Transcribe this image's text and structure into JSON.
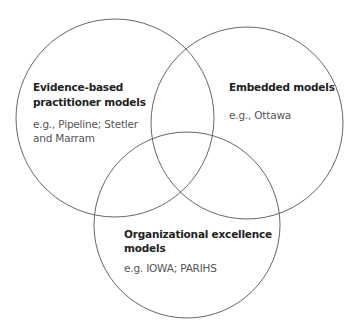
{
  "diagram": {
    "type": "venn",
    "circles": [
      {
        "id": "evidence-based",
        "title_lines": [
          "Evidence-based",
          "practitioner models"
        ],
        "example_lines": [
          "e.g., Pipeline; Stetler",
          "and Marram"
        ]
      },
      {
        "id": "embedded",
        "title_lines": [
          "Embedded models"
        ],
        "example_lines": [
          "e.g., Ottawa"
        ]
      },
      {
        "id": "organizational-excellence",
        "title_lines": [
          "Organizational excellence",
          "models"
        ],
        "example_lines": [
          "e.g. IOWA; PARIHS"
        ]
      }
    ],
    "stroke_color": "#555555"
  }
}
